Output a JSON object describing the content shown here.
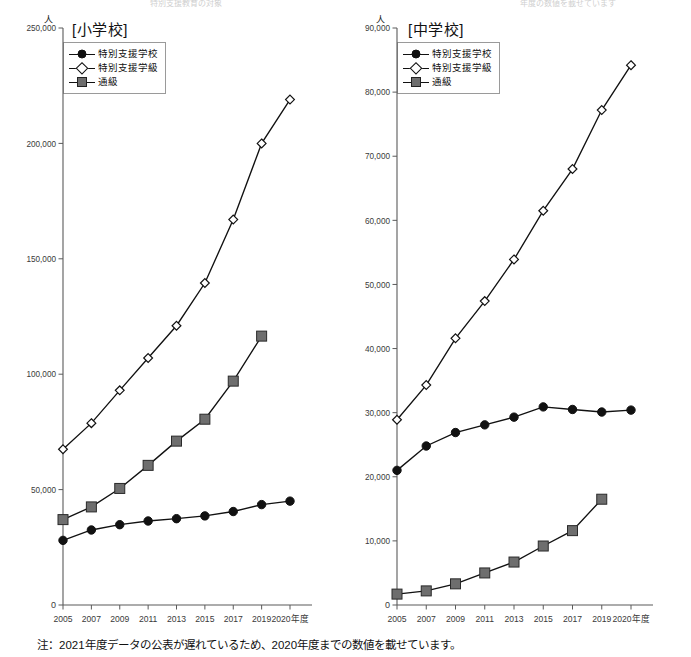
{
  "top_bleed": {
    "left_fragment": "特別支援教育の対象",
    "right_fragment": "年度の数値を載せています"
  },
  "footnote": "注：2021年度データの公表が遅れているため、2020年度までの数値を載せています。",
  "series_names": {
    "school": "特別支援学校",
    "class": "特別支援学級",
    "tsukyu": "通級"
  },
  "unit_label": "人",
  "chart_data": [
    {
      "type": "line",
      "title": "[小学校]",
      "xlabel": "",
      "ylabel": "人",
      "x_axis_suffix": "年度",
      "categories": [
        "2005",
        "2007",
        "2009",
        "2011",
        "2013",
        "2015",
        "2017",
        "2019",
        "2020年度"
      ],
      "x_values": [
        2005,
        2007,
        2009,
        2011,
        2013,
        2015,
        2017,
        2019,
        2020
      ],
      "ylim": [
        0,
        250000
      ],
      "yticks": [
        0,
        50000,
        100000,
        150000,
        200000,
        250000
      ],
      "ytick_labels": [
        "0",
        "50,000",
        "100,000",
        "150,000",
        "200,000",
        "250,000"
      ],
      "grid": false,
      "legend_position": "top-left",
      "series": [
        {
          "name": "特別支援学校",
          "marker": "filled-circle",
          "values": [
            28000,
            32500,
            34800,
            36400,
            37400,
            38600,
            40500,
            43500,
            45000
          ]
        },
        {
          "name": "特別支援学級",
          "marker": "open-diamond",
          "values": [
            67500,
            78800,
            93000,
            107000,
            121000,
            139500,
            167000,
            200000,
            219000
          ]
        },
        {
          "name": "通級",
          "marker": "filled-square",
          "values": [
            37000,
            42500,
            50500,
            60500,
            71000,
            80500,
            97000,
            116500,
            null
          ]
        }
      ]
    },
    {
      "type": "line",
      "title": "[中学校]",
      "xlabel": "",
      "ylabel": "人",
      "x_axis_suffix": "年度",
      "categories": [
        "2005",
        "2007",
        "2009",
        "2011",
        "2013",
        "2015",
        "2017",
        "2019",
        "2020年度"
      ],
      "x_values": [
        2005,
        2007,
        2009,
        2011,
        2013,
        2015,
        2017,
        2019,
        2020
      ],
      "ylim": [
        0,
        90000
      ],
      "yticks": [
        0,
        10000,
        20000,
        30000,
        40000,
        50000,
        60000,
        70000,
        80000,
        90000
      ],
      "ytick_labels": [
        "0",
        "10,000",
        "20,000",
        "30,000",
        "40,000",
        "50,000",
        "60,000",
        "70,000",
        "80,000",
        "90,000"
      ],
      "grid": false,
      "legend_position": "top-left",
      "series": [
        {
          "name": "特別支援学校",
          "marker": "filled-circle",
          "values": [
            21000,
            24800,
            26900,
            28100,
            29300,
            30900,
            30500,
            30100,
            30400
          ]
        },
        {
          "name": "特別支援学級",
          "marker": "open-diamond",
          "values": [
            28900,
            34300,
            41600,
            47400,
            53900,
            61500,
            68000,
            77200,
            84200
          ]
        },
        {
          "name": "通級",
          "marker": "filled-square",
          "values": [
            1700,
            2200,
            3300,
            5000,
            6700,
            9200,
            11600,
            16500,
            null
          ]
        }
      ]
    }
  ]
}
